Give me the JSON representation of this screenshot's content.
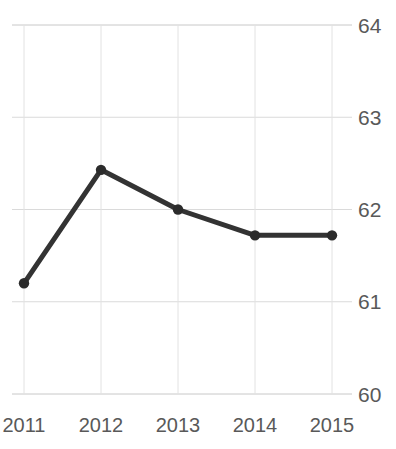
{
  "chart_data": {
    "type": "line",
    "title": "Freedom Trend",
    "xlabel": "",
    "ylabel": "",
    "categories": [
      "2011",
      "2012",
      "2013",
      "2014",
      "2015"
    ],
    "x": [
      2011,
      2012,
      2013,
      2014,
      2015
    ],
    "values": [
      61.2,
      62.43,
      62.0,
      61.72,
      61.72
    ],
    "series": [
      {
        "name": "Freedom Trend",
        "values": [
          61.2,
          62.43,
          62.0,
          61.72,
          61.72
        ]
      }
    ],
    "ylim": [
      60,
      64
    ],
    "yticks": [
      64,
      63,
      62,
      61,
      60
    ],
    "ytick_labels": [
      "64",
      "63",
      "62",
      "61",
      "60"
    ],
    "xticks": [
      "2011",
      "2012",
      "2013",
      "2014",
      "2015"
    ],
    "grid": true,
    "grid_axes": "both",
    "legend": false,
    "legend_position": "none",
    "y_axis_side": "right",
    "marker": "circle",
    "colors": {
      "line": "#333333",
      "marker": "#2b2b2b",
      "grid": "#d9d9d9",
      "axis": "#bfbfbf",
      "tick_label": "#595959",
      "title": "#262626",
      "background": "#ffffff"
    }
  }
}
